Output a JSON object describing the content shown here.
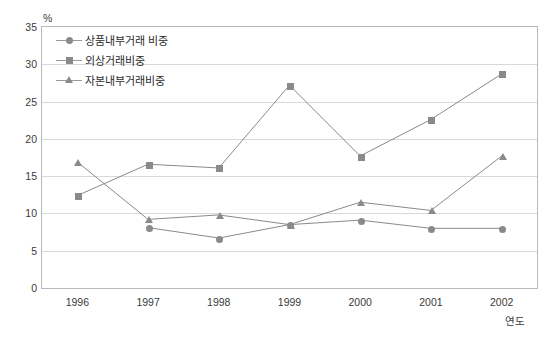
{
  "chart_data": {
    "type": "line",
    "title": "",
    "xlabel": "연도",
    "ylabel": "",
    "y_unit": "%",
    "categories": [
      "1996",
      "1997",
      "1998",
      "1999",
      "2000",
      "2001",
      "2002"
    ],
    "ylim": [
      0,
      35
    ],
    "ytick_step": 5,
    "yticks": [
      "35",
      "30",
      "25",
      "20",
      "15",
      "10",
      "5",
      "0"
    ],
    "grid": true,
    "legend_position": "top-left",
    "series": [
      {
        "name": "상품내부거래 비중",
        "marker": "circle",
        "color": "#8a8a8a",
        "values": [
          null,
          8.1,
          6.7,
          8.5,
          9.1,
          8.0,
          8.0
        ]
      },
      {
        "name": "외상거래비중",
        "marker": "square",
        "color": "#8a8a8a",
        "values": [
          12.4,
          16.6,
          16.1,
          27.2,
          17.7,
          22.6,
          28.7
        ]
      },
      {
        "name": "자본내부거래비중",
        "marker": "triangle",
        "color": "#8a8a8a",
        "values": [
          16.9,
          9.2,
          9.8,
          8.5,
          11.5,
          10.4,
          17.7
        ]
      }
    ]
  },
  "legend": {
    "items": [
      {
        "label": "상품내부거래 비중",
        "marker": "circle"
      },
      {
        "label": "외상거래비중",
        "marker": "square"
      },
      {
        "label": "자본내부거래비중",
        "marker": "triangle"
      }
    ]
  },
  "axis": {
    "y_unit_label": "%",
    "x_title": "연도"
  }
}
